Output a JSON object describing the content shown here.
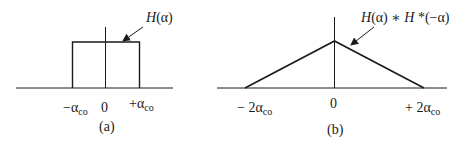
{
  "panel_a": {
    "caption": "(a)",
    "curve_label": "H(α)",
    "tick_left": "−α",
    "tick_left_sub": "co",
    "tick_zero": "0",
    "tick_right": "+α",
    "tick_right_sub": "co",
    "shape": "rectangle"
  },
  "panel_b": {
    "caption": "(b)",
    "curve_label_prefix": "H",
    "curve_label_mid": "(α) ∗ ",
    "curve_label_h2": "H",
    "curve_label_suffix": " *(−α)",
    "tick_left": "− 2α",
    "tick_left_sub": "co",
    "tick_zero": "0",
    "tick_right": "+ 2α",
    "tick_right_sub": "co",
    "shape": "triangle"
  },
  "colors": {
    "line": "#1a1a1a",
    "background": "#ffffff"
  }
}
